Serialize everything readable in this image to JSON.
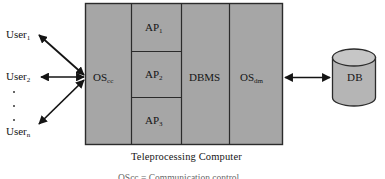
{
  "figure": {
    "caption": "Teleprocessing Computer",
    "legend_line": "OScc = Communication control",
    "colors": {
      "box_fill": "#a6a6a6",
      "box_stroke": "#2b2b2b",
      "cylinder_fill": "#b5b5b5",
      "cylinder_top_fill": "#c6c6c6",
      "arrow": "#141414",
      "background": "#ffffff"
    }
  },
  "users": [
    {
      "name": "user-1",
      "text": "User",
      "sub": "1"
    },
    {
      "name": "user-2",
      "text": "User",
      "sub": "2"
    },
    {
      "name": "user-n",
      "text": "User",
      "sub": "n"
    }
  ],
  "computer": {
    "os_cc": {
      "text": "OS",
      "sub": "cc"
    },
    "dbms": {
      "text": "DBMS",
      "sub": ""
    },
    "os_dm": {
      "text": "OS",
      "sub": "dm"
    },
    "applications": [
      {
        "text": "AP",
        "sub": "1"
      },
      {
        "text": "AP",
        "sub": "2"
      },
      {
        "text": "AP",
        "sub": "3"
      }
    ]
  },
  "database": {
    "label": "DB"
  }
}
